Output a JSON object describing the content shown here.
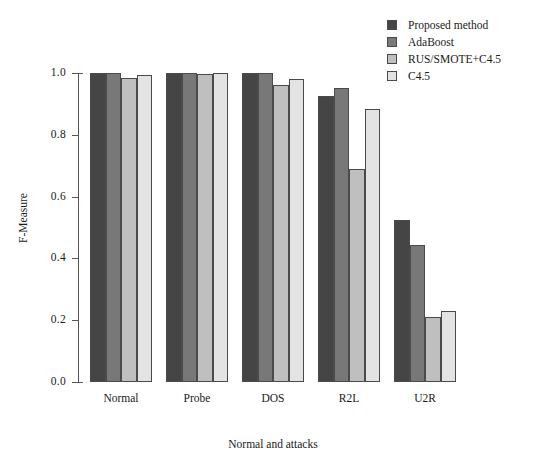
{
  "chart_data": {
    "type": "bar",
    "title": "",
    "xlabel": "Normal and attacks",
    "ylabel": "F-Measure",
    "ylim": [
      0.0,
      1.0
    ],
    "ytick_labels": [
      "0.0",
      "0.2",
      "0.4",
      "0.6",
      "0.8",
      "1.0"
    ],
    "yticks": [
      0.0,
      0.2,
      0.4,
      0.6,
      0.8,
      1.0
    ],
    "grid": false,
    "legend_position": "top-right",
    "categories": [
      "Normal",
      "Probe",
      "DOS",
      "R2L",
      "U2R"
    ],
    "series": [
      {
        "name": "Proposed method",
        "color": "#454545",
        "values": [
          1.0,
          1.0,
          1.0,
          0.925,
          0.525
        ]
      },
      {
        "name": "AdaBoost",
        "color": "#787878",
        "values": [
          1.0,
          1.0,
          1.0,
          0.95,
          0.445
        ]
      },
      {
        "name": "RUS/SMOTE+C4.5",
        "color": "#bfbfbf",
        "values": [
          0.985,
          0.997,
          0.96,
          0.69,
          0.21
        ]
      },
      {
        "name": "C4.5",
        "color": "#e3e3e3",
        "values": [
          0.995,
          1.0,
          0.98,
          0.885,
          0.23
        ]
      }
    ]
  }
}
